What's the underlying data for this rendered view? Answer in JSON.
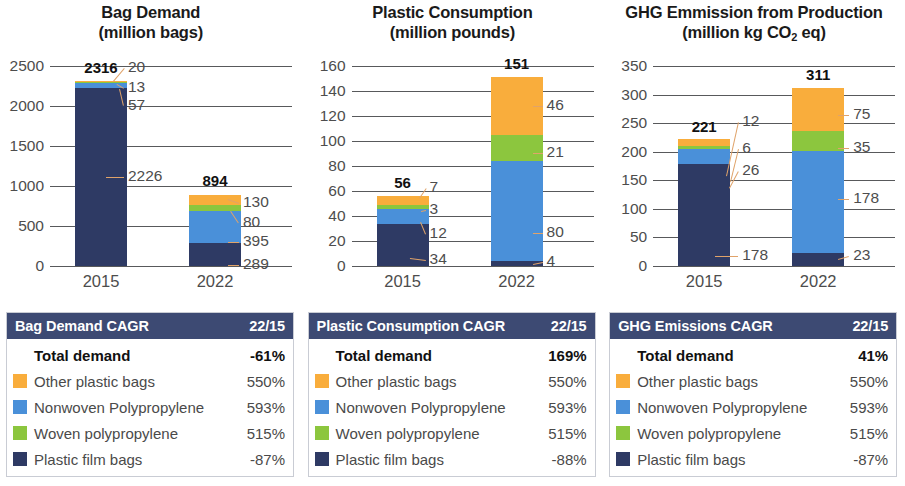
{
  "colors": {
    "other_plastic_bags": "#f9ad3c",
    "nonwoven_polypropylene": "#4a90d9",
    "woven_polypropylene": "#8cc63e",
    "plastic_film_bags": "#2e3a64",
    "table_header_bg": "#3d4a73",
    "axis": "#58595b",
    "leader": "#e0a36a"
  },
  "panels": [
    {
      "id": "bag-demand",
      "title_line1": "Bag Demand",
      "title_line2": "(million bags)",
      "chart_data": {
        "type": "bar",
        "title": "Bag Demand (million bags)",
        "subtitle": "",
        "xlabel": "",
        "ylabel": "million bags",
        "stacked": true,
        "categories": [
          "2015",
          "2022"
        ],
        "ylim": [
          0,
          2500
        ],
        "yticks": [
          0,
          500,
          1000,
          1500,
          2000,
          2500
        ],
        "grid": true,
        "legend": "below-table",
        "series": [
          {
            "name": "Plastic film bags",
            "values": [
              2226,
              289
            ]
          },
          {
            "name": "Nonwoven Polypropylene",
            "values": [
              57,
              395
            ]
          },
          {
            "name": "Woven polypropylene",
            "values": [
              13,
              80
            ]
          },
          {
            "name": "Other plastic bags",
            "values": [
              20,
              130
            ]
          }
        ],
        "totals": [
          2316,
          894
        ],
        "annotations": [
          {
            "category": "2015",
            "series": "Other plastic bags",
            "value": "20"
          },
          {
            "category": "2015",
            "series": "Woven polypropylene",
            "value": "13"
          },
          {
            "category": "2015",
            "series": "Nonwoven Polypropylene",
            "value": "57"
          },
          {
            "category": "2015",
            "series": "Plastic film bags",
            "value": "2226"
          },
          {
            "category": "2022",
            "series": "Other plastic bags",
            "value": "130"
          },
          {
            "category": "2022",
            "series": "Woven polypropylene",
            "value": "80"
          },
          {
            "category": "2022",
            "series": "Nonwoven Polypropylene",
            "value": "395"
          },
          {
            "category": "2022",
            "series": "Plastic film bags",
            "value": "289"
          }
        ]
      },
      "table": {
        "header_label": "Bag Demand CAGR",
        "header_value": "22/15",
        "rows": [
          {
            "label": "Total demand",
            "value": "-61%",
            "swatch": null,
            "total": true
          },
          {
            "label": "Other plastic bags",
            "value": "550%",
            "swatch": "#f9ad3c",
            "total": false
          },
          {
            "label": "Nonwoven Polypropylene",
            "value": "593%",
            "swatch": "#4a90d9",
            "total": false
          },
          {
            "label": "Woven polypropylene",
            "value": "515%",
            "swatch": "#8cc63e",
            "total": false
          },
          {
            "label": "Plastic film bags",
            "value": "-87%",
            "swatch": "#2e3a64",
            "total": false
          }
        ]
      }
    },
    {
      "id": "plastic-consumption",
      "title_line1": "Plastic Consumption",
      "title_line2": "(million pounds)",
      "chart_data": {
        "type": "bar",
        "title": "Plastic Consumption (million pounds)",
        "subtitle": "",
        "xlabel": "",
        "ylabel": "million pounds",
        "stacked": true,
        "categories": [
          "2015",
          "2022"
        ],
        "ylim": [
          0,
          160
        ],
        "yticks": [
          0,
          20,
          40,
          60,
          80,
          100,
          120,
          140,
          160
        ],
        "grid": true,
        "legend": "below-table",
        "series": [
          {
            "name": "Plastic film bags",
            "values": [
              34,
              4
            ]
          },
          {
            "name": "Nonwoven Polypropylene",
            "values": [
              12,
              80
            ]
          },
          {
            "name": "Woven polypropylene",
            "values": [
              3,
              21
            ]
          },
          {
            "name": "Other plastic bags",
            "values": [
              7,
              46
            ]
          }
        ],
        "totals": [
          56,
          151
        ],
        "annotations": [
          {
            "category": "2015",
            "series": "Other plastic bags",
            "value": "7"
          },
          {
            "category": "2015",
            "series": "Woven polypropylene",
            "value": "3"
          },
          {
            "category": "2015",
            "series": "Nonwoven Polypropylene",
            "value": "12"
          },
          {
            "category": "2015",
            "series": "Plastic film bags",
            "value": "34"
          },
          {
            "category": "2022",
            "series": "Other plastic bags",
            "value": "46"
          },
          {
            "category": "2022",
            "series": "Woven polypropylene",
            "value": "21"
          },
          {
            "category": "2022",
            "series": "Nonwoven Polypropylene",
            "value": "80"
          },
          {
            "category": "2022",
            "series": "Plastic film bags",
            "value": "4"
          }
        ]
      },
      "table": {
        "header_label": "Plastic Consumption CAGR",
        "header_value": "22/15",
        "rows": [
          {
            "label": "Total demand",
            "value": "169%",
            "swatch": null,
            "total": true
          },
          {
            "label": "Other plastic bags",
            "value": "550%",
            "swatch": "#f9ad3c",
            "total": false
          },
          {
            "label": "Nonwoven Polypropylene",
            "value": "593%",
            "swatch": "#4a90d9",
            "total": false
          },
          {
            "label": "Woven polypropylene",
            "value": "515%",
            "swatch": "#8cc63e",
            "total": false
          },
          {
            "label": "Plastic film bags",
            "value": "-88%",
            "swatch": "#2e3a64",
            "total": false
          }
        ]
      }
    },
    {
      "id": "ghg-emission",
      "title_line1": "GHG Emmission from Production",
      "title_line2": "(million kg CO2 eq)",
      "title_line2_pre": "(million kg CO",
      "title_line2_sub": "2",
      "title_line2_post": " eq)",
      "chart_data": {
        "type": "bar",
        "title": "GHG Emmission from Production (million kg CO2 eq)",
        "subtitle": "",
        "xlabel": "",
        "ylabel": "million kg CO2 eq",
        "stacked": true,
        "categories": [
          "2015",
          "2022"
        ],
        "ylim": [
          0,
          350
        ],
        "yticks": [
          0,
          50,
          100,
          150,
          200,
          250,
          300,
          350
        ],
        "grid": true,
        "legend": "below-table",
        "series": [
          {
            "name": "Plastic film bags",
            "values": [
              178,
              23
            ]
          },
          {
            "name": "Nonwoven Polypropylene",
            "values": [
              26,
              178
            ]
          },
          {
            "name": "Woven polypropylene",
            "values": [
              6,
              35
            ]
          },
          {
            "name": "Other plastic bags",
            "values": [
              12,
              75
            ]
          }
        ],
        "totals": [
          221,
          311
        ],
        "annotations": [
          {
            "category": "2015",
            "series": "Other plastic bags",
            "value": "12"
          },
          {
            "category": "2015",
            "series": "Woven polypropylene",
            "value": "6"
          },
          {
            "category": "2015",
            "series": "Nonwoven Polypropylene",
            "value": "26"
          },
          {
            "category": "2015",
            "series": "Plastic film bags",
            "value": "178"
          },
          {
            "category": "2022",
            "series": "Other plastic bags",
            "value": "75"
          },
          {
            "category": "2022",
            "series": "Woven polypropylene",
            "value": "35"
          },
          {
            "category": "2022",
            "series": "Nonwoven Polypropylene",
            "value": "178"
          },
          {
            "category": "2022",
            "series": "Plastic film bags",
            "value": "23"
          }
        ]
      },
      "table": {
        "header_label": "GHG Emissions CAGR",
        "header_value": "22/15",
        "rows": [
          {
            "label": "Total demand",
            "value": "41%",
            "swatch": null,
            "total": true
          },
          {
            "label": "Other plastic bags",
            "value": "550%",
            "swatch": "#f9ad3c",
            "total": false
          },
          {
            "label": "Nonwoven Polypropylene",
            "value": "593%",
            "swatch": "#4a90d9",
            "total": false
          },
          {
            "label": "Woven polypropylene",
            "value": "515%",
            "swatch": "#8cc63e",
            "total": false
          },
          {
            "label": "Plastic film bags",
            "value": "-87%",
            "swatch": "#2e3a64",
            "total": false
          }
        ]
      }
    }
  ]
}
